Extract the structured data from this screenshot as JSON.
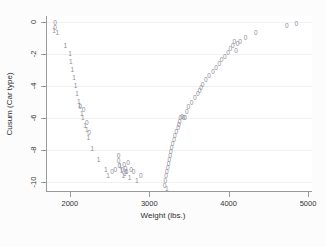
{
  "chart_data": {
    "type": "scatter",
    "title": "",
    "xlabel": "Weight (lbs.)",
    "ylabel": "Cusum (Car type)",
    "xlim": [
      1700,
      5050
    ],
    "ylim": [
      -10.6,
      0.4
    ],
    "xticks": [
      2000,
      3000,
      4000,
      5000
    ],
    "yticks": [
      0,
      -2,
      -4,
      -6,
      -8,
      -10
    ],
    "grid": true,
    "legend": "none",
    "marker_glyphs": {
      "group0": "0",
      "group1": "1"
    },
    "marker_color": "#8c8c98",
    "series": [
      {
        "name": "0",
        "glyph": "0",
        "points": [
          [
            1800,
            -0.05
          ],
          [
            1800,
            -0.35
          ],
          [
            2120,
            -5.3
          ],
          [
            2160,
            -5.5
          ],
          [
            2200,
            -6.3
          ],
          [
            2230,
            -6.9
          ],
          [
            2520,
            -9.35
          ],
          [
            2560,
            -9.25
          ],
          [
            2600,
            -8.35
          ],
          [
            2600,
            -8.65
          ],
          [
            2610,
            -9.0
          ],
          [
            2650,
            -9.2
          ],
          [
            2670,
            -8.9
          ],
          [
            2690,
            -9.15
          ],
          [
            2700,
            -9.35
          ],
          [
            2720,
            -8.8
          ],
          [
            2760,
            -9.2
          ],
          [
            2790,
            -9.35
          ],
          [
            2880,
            -9.6
          ],
          [
            3180,
            -10.2
          ],
          [
            3190,
            -9.9
          ],
          [
            3200,
            -9.6
          ],
          [
            3210,
            -9.35
          ],
          [
            3220,
            -9.1
          ],
          [
            3230,
            -8.85
          ],
          [
            3240,
            -8.6
          ],
          [
            3250,
            -8.35
          ],
          [
            3260,
            -8.1
          ],
          [
            3270,
            -7.85
          ],
          [
            3280,
            -7.6
          ],
          [
            3300,
            -7.35
          ],
          [
            3310,
            -7.1
          ],
          [
            3330,
            -6.85
          ],
          [
            3350,
            -6.6
          ],
          [
            3360,
            -6.4
          ],
          [
            3370,
            -6.2
          ],
          [
            3380,
            -6.0
          ],
          [
            3400,
            -5.9
          ],
          [
            3420,
            -5.95
          ],
          [
            3440,
            -6.0
          ],
          [
            3460,
            -5.6
          ],
          [
            3480,
            -5.3
          ],
          [
            3520,
            -5.05
          ],
          [
            3560,
            -4.75
          ],
          [
            3600,
            -4.5
          ],
          [
            3620,
            -4.3
          ],
          [
            3640,
            -4.1
          ],
          [
            3660,
            -3.9
          ],
          [
            3700,
            -3.6
          ],
          [
            3740,
            -3.35
          ],
          [
            3790,
            -3.1
          ],
          [
            3830,
            -2.85
          ],
          [
            3870,
            -2.6
          ],
          [
            3900,
            -2.35
          ],
          [
            3940,
            -2.15
          ],
          [
            3980,
            -1.9
          ],
          [
            4010,
            -1.65
          ],
          [
            4040,
            -1.5
          ],
          [
            4060,
            -1.25
          ],
          [
            4080,
            -1.8
          ],
          [
            4100,
            -1.35
          ],
          [
            4130,
            -1.2
          ],
          [
            4200,
            -0.95
          ],
          [
            4330,
            -0.65
          ],
          [
            4720,
            -0.2
          ],
          [
            4840,
            -0.08
          ]
        ]
      },
      {
        "name": "1",
        "glyph": "1",
        "points": [
          [
            1790,
            -0.55
          ],
          [
            1830,
            -0.65
          ],
          [
            1930,
            -1.45
          ],
          [
            1990,
            -1.95
          ],
          [
            2000,
            -2.45
          ],
          [
            2020,
            -2.95
          ],
          [
            2040,
            -3.45
          ],
          [
            2060,
            -3.95
          ],
          [
            2080,
            -4.45
          ],
          [
            2100,
            -4.95
          ],
          [
            2110,
            -5.2
          ],
          [
            2140,
            -5.7
          ],
          [
            2150,
            -5.95
          ],
          [
            2180,
            -6.5
          ],
          [
            2200,
            -6.75
          ],
          [
            2220,
            -7.2
          ],
          [
            2270,
            -7.9
          ],
          [
            2350,
            -8.6
          ],
          [
            2440,
            -9.2
          ],
          [
            2470,
            -9.6
          ],
          [
            2620,
            -9.0
          ],
          [
            2640,
            -9.3
          ],
          [
            2660,
            -9.6
          ],
          [
            2680,
            -9.5
          ],
          [
            2700,
            -9.35
          ],
          [
            2740,
            -9.75
          ],
          [
            2830,
            -9.9
          ],
          [
            3210,
            -10.4
          ]
        ]
      }
    ]
  }
}
